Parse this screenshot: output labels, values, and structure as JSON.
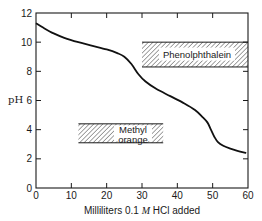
{
  "chart_data": {
    "type": "line",
    "title": "",
    "xlabel": "Milliliters 0.1 M HCl added",
    "xlabel_parts": {
      "pre": "Milliliters 0.1 ",
      "italic": "M",
      "post": " HCl added"
    },
    "ylabel": "pH",
    "xlim": [
      0,
      60
    ],
    "ylim": [
      0,
      12
    ],
    "xticks": [
      0,
      10,
      20,
      30,
      40,
      50,
      60
    ],
    "yticks": [
      0,
      2,
      4,
      6,
      8,
      10,
      12
    ],
    "grid": false,
    "legend": null,
    "series": [
      {
        "name": "Titration curve",
        "x": [
          0,
          2,
          5,
          8,
          12,
          16,
          20,
          23,
          25,
          27,
          29,
          31,
          34,
          38,
          42,
          45,
          47,
          48.5,
          49.5,
          50.5,
          51.5,
          53,
          55,
          57,
          59.5
        ],
        "y": [
          11.3,
          11.0,
          10.6,
          10.3,
          10.0,
          9.75,
          9.5,
          9.25,
          9.0,
          8.5,
          7.8,
          7.3,
          6.8,
          6.3,
          5.8,
          5.35,
          4.9,
          4.5,
          4.0,
          3.5,
          3.15,
          2.9,
          2.7,
          2.55,
          2.4
        ]
      }
    ],
    "annotations": [
      {
        "label": "Phenolphthalein",
        "x_range": [
          30,
          60
        ],
        "y_range": [
          8.3,
          10.0
        ],
        "style": "hatched"
      },
      {
        "label": "Methyl orange",
        "label_lines": [
          "Methyl",
          "orange"
        ],
        "x_range": [
          12,
          36
        ],
        "y_range": [
          3.1,
          4.4
        ],
        "style": "hatched"
      }
    ]
  }
}
